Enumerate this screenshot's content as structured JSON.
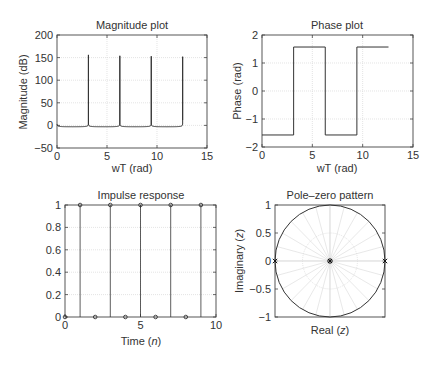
{
  "chart_data": [
    {
      "type": "line",
      "title": "Magnitude plot",
      "xlabel": "wT (rad)",
      "ylabel": "Magnitude (dB)",
      "xlim": [
        0,
        15
      ],
      "ylim": [
        -50,
        200
      ],
      "xticks": [
        0,
        5,
        10,
        15
      ],
      "yticks": [
        -50,
        0,
        50,
        100,
        150,
        200
      ],
      "grid": true,
      "series": [
        {
          "name": "|H|",
          "x_range": [
            0,
            12.566
          ],
          "baseline_db": -3,
          "peaks": [
            {
              "x": 3.1416,
              "y": 156
            },
            {
              "x": 6.2832,
              "y": 154
            },
            {
              "x": 9.4248,
              "y": 153
            },
            {
              "x": 12.566,
              "y": 152
            }
          ]
        }
      ]
    },
    {
      "type": "line",
      "title": "Phase plot",
      "xlabel": "wT (rad)",
      "ylabel": "Phase (rad)",
      "xlim": [
        0,
        15
      ],
      "ylim": [
        -2,
        2
      ],
      "xticks": [
        0,
        5,
        10,
        15
      ],
      "yticks": [
        -2,
        -1,
        0,
        1,
        2
      ],
      "grid": true,
      "series": [
        {
          "name": "phase",
          "x": [
            0,
            3.1416,
            3.1416,
            6.2832,
            6.2832,
            9.4248,
            9.4248,
            12.566
          ],
          "y": [
            -1.5708,
            -1.5708,
            1.5708,
            1.5708,
            -1.5708,
            -1.5708,
            1.5708,
            1.5708
          ]
        }
      ]
    },
    {
      "type": "scatter",
      "title": "Impulse response",
      "xlabel": "Time (n)",
      "ylabel": "",
      "xlim": [
        0,
        10
      ],
      "ylim": [
        0,
        1
      ],
      "xticks": [
        0,
        5,
        10
      ],
      "yticks": [
        0,
        0.2,
        0.4,
        0.6,
        0.8,
        1
      ],
      "ytick_labels": [
        "0",
        "0.2",
        "0.4",
        "0.6",
        "0.8",
        "1"
      ],
      "grid": true,
      "series": [
        {
          "name": "h[n]",
          "x": [
            0,
            1,
            2,
            3,
            4,
            5,
            6,
            7,
            8,
            9
          ],
          "y": [
            0,
            1,
            0,
            1,
            0,
            1,
            0,
            1,
            0,
            1
          ]
        }
      ]
    },
    {
      "type": "scatter",
      "title": "Pole–zero pattern",
      "xlabel": "Real (z)",
      "ylabel": "Imaginary (z)",
      "xlim": [
        -1,
        1
      ],
      "ylim": [
        -1,
        1
      ],
      "yticks": [
        -1,
        -0.5,
        0,
        0.5,
        1
      ],
      "ytick_labels": [
        "−1",
        "−0.5",
        "0",
        "0.5",
        "1"
      ],
      "grid": "polar",
      "unit_circle": true,
      "poles": [
        {
          "re": -1,
          "im": 0
        },
        {
          "re": 1,
          "im": 0
        }
      ],
      "zeros": [
        {
          "re": 0,
          "im": 0
        }
      ]
    }
  ],
  "labels": {
    "mag_title": "Magnitude plot",
    "mag_xlabel": "wT (rad)",
    "mag_ylabel": "Magnitude (dB)",
    "phase_title": "Phase plot",
    "phase_xlabel": "wT (rad)",
    "phase_ylabel": "Phase (rad)",
    "imp_title": "Impulse response",
    "imp_xlabel_pre": "Time (",
    "imp_xlabel_var": "n",
    "imp_xlabel_post": ")",
    "pz_title": "Pole–zero pattern",
    "pz_xlabel_pre": "Real (",
    "pz_xlabel_var": "z",
    "pz_xlabel_post": ")",
    "pz_ylabel_pre": "Imaginary (",
    "pz_ylabel_var": "z",
    "pz_ylabel_post": ")"
  }
}
